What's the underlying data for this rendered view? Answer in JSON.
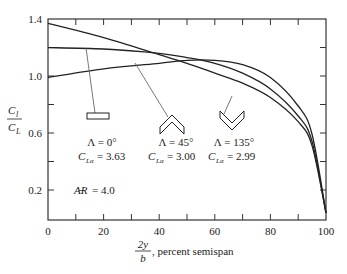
{
  "chart_data": {
    "type": "line",
    "title": "",
    "xlabel": "2y/b, percent semispan",
    "ylabel": "C_l / C_L",
    "xlim": [
      0,
      100
    ],
    "ylim": [
      0,
      1.4
    ],
    "x_ticks": [
      0,
      20,
      40,
      60,
      80,
      100
    ],
    "x_minor_ticks": [
      10,
      30,
      50,
      70,
      90
    ],
    "y_ticks": [
      0.2,
      0.6,
      1.0,
      1.4
    ],
    "y_minor_ticks": [
      0.4,
      0.8,
      1.2
    ],
    "grid": false,
    "x": [
      0,
      20,
      40,
      50,
      60,
      70,
      80,
      90,
      95,
      100
    ],
    "series": [
      {
        "name": "Λ = 0° (C_Lα = 3.63)",
        "sweep": "0°",
        "CLa": "3.63",
        "planform": "rectangle",
        "values": [
          1.21,
          1.2,
          1.17,
          1.14,
          1.1,
          1.03,
          0.92,
          0.73,
          0.55,
          0.05
        ]
      },
      {
        "name": "Λ = 45° (C_Lα = 3.00)",
        "sweep": "45°",
        "CLa": "3.00",
        "planform": "swept-back chevron",
        "values": [
          1.0,
          1.06,
          1.1,
          1.12,
          1.12,
          1.09,
          1.0,
          0.8,
          0.6,
          0.05
        ]
      },
      {
        "name": "Λ = 135° (C_Lα = 2.99)",
        "sweep": "135°",
        "CLa": "2.99",
        "planform": "swept-forward chevron",
        "values": [
          1.38,
          1.28,
          1.16,
          1.1,
          1.03,
          0.96,
          0.86,
          0.69,
          0.52,
          0.05
        ]
      }
    ],
    "annotations": [
      "Λ = 0°",
      "C_Lα = 3.63",
      "Λ = 45°",
      "C_Lα = 3.00",
      "Λ = 135°",
      "C_Lα = 2.99",
      "AR = 4.0"
    ]
  },
  "axes": {
    "y_tick_labels": [
      "1.4",
      "1.0",
      "0.6",
      "0.2"
    ],
    "x_tick_labels": [
      "0",
      "20",
      "40",
      "60",
      "80",
      "100"
    ],
    "ylabel_num": "C",
    "ylabel_num_sub": "l",
    "ylabel_den": "C",
    "ylabel_den_sub": "L",
    "xlabel_num": "2y",
    "xlabel_den": "b",
    "xlabel_text": ", percent semispan"
  },
  "labels": {
    "l0_sweep": "Λ = 0°",
    "l0_cla_lhs": "C",
    "l0_cla_sub": "Lα",
    "l0_cla_rhs": "= 3.63",
    "l45_sweep": "Λ = 45°",
    "l45_cla_lhs": "C",
    "l45_cla_sub": "Lα",
    "l45_cla_rhs": "= 3.00",
    "l135_sweep": "Λ = 135°",
    "l135_cla_lhs": "C",
    "l135_cla_sub": "Lα",
    "l135_cla_rhs": "= 2.99",
    "ar_symbol": "A̶R",
    "ar_value": "= 4.0"
  },
  "colors": {
    "line": "#222222",
    "pointer": "#555555",
    "background": "#ffffff"
  }
}
